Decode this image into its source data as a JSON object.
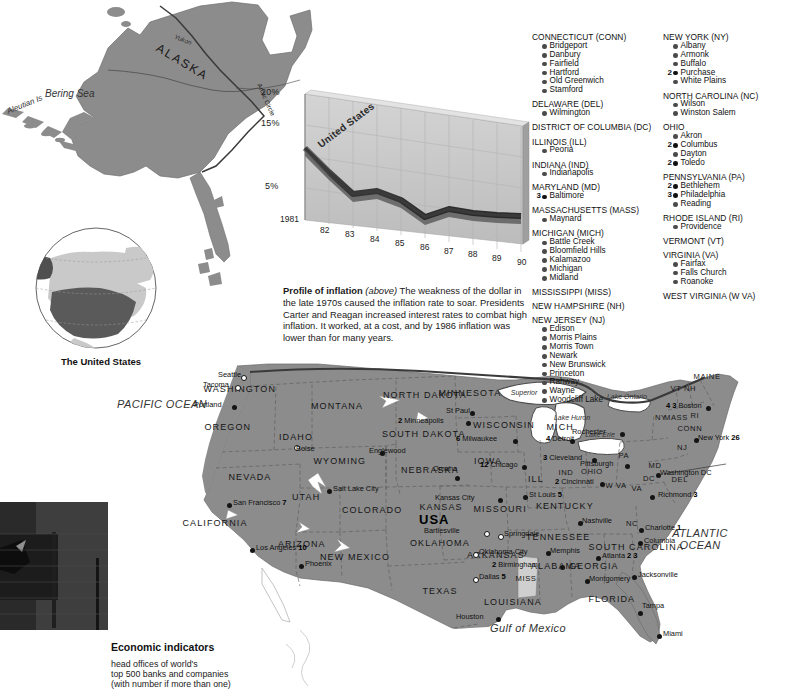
{
  "page": {
    "title": "The United States",
    "globe_caption": "The United States"
  },
  "chart_data": {
    "type": "line",
    "title": "Profile of inflation",
    "series_name": "United States",
    "xlabel": "",
    "ylabel": "",
    "ylim": [
      0,
      20
    ],
    "ytick_labels": [
      "20%",
      "15%",
      "5%"
    ],
    "ytick_values": [
      20,
      15,
      5
    ],
    "grid": true,
    "legend_position": "inline-on-line",
    "categories": [
      "1981",
      "82",
      "83",
      "84",
      "85",
      "86",
      "87",
      "88",
      "89",
      "90"
    ],
    "x": [
      1981,
      1982,
      1983,
      1984,
      1985,
      1986,
      1987,
      1988,
      1989,
      1990
    ],
    "values": [
      10.3,
      6.2,
      3.2,
      4.3,
      3.6,
      1.9,
      3.6,
      4.1,
      4.8,
      5.4
    ],
    "annotations": [
      "United States"
    ]
  },
  "inflation_caption": {
    "lead": "Profile of inflation",
    "italic": "(above)",
    "body": " The weakness of the dollar in the late 1970s caused the inflation rate to soar. Presidents Carter and Reagan increased interest rates to combat high inflation. It worked, at a cost, and by 1986 inflation was lower than for many years."
  },
  "legend": {
    "title": "Economic indicators",
    "lines": [
      "head offices of world's",
      "top 500 banks and companies",
      "(with number if more than one)"
    ]
  },
  "directory": {
    "column1": [
      {
        "state": "CONNECTICUT (CONN)",
        "cities": [
          {
            "name": "Bridgeport",
            "count": ""
          },
          {
            "name": "Danbury",
            "count": ""
          },
          {
            "name": "Fairfield",
            "count": ""
          },
          {
            "name": "Hartford",
            "count": ""
          },
          {
            "name": "Old Greenwich",
            "count": ""
          },
          {
            "name": "Stamford",
            "count": ""
          }
        ]
      },
      {
        "state": "DELAWARE (DEL)",
        "cities": [
          {
            "name": "Wilmington",
            "count": ""
          }
        ]
      },
      {
        "state": "DISTRICT OF COLUMBIA (DC)",
        "cities": []
      },
      {
        "state": "ILLINOIS (ILL)",
        "cities": [
          {
            "name": "Peoria",
            "count": ""
          }
        ]
      },
      {
        "state": "INDIANA (IND)",
        "cities": [
          {
            "name": "Indianapolis",
            "count": ""
          }
        ]
      },
      {
        "state": "MARYLAND (MD)",
        "cities": [
          {
            "name": "Baltimore",
            "count": "3"
          }
        ]
      },
      {
        "state": "MASSACHUSETTS (MASS)",
        "cities": [
          {
            "name": "Maynard",
            "count": ""
          }
        ]
      },
      {
        "state": "MICHIGAN (MICH)",
        "cities": [
          {
            "name": "Battle Creek",
            "count": ""
          },
          {
            "name": "Bloomfield Hills",
            "count": ""
          },
          {
            "name": "Kalamazoo",
            "count": ""
          },
          {
            "name": "Michigan",
            "count": ""
          },
          {
            "name": "Midland",
            "count": ""
          }
        ]
      },
      {
        "state": "MISSISSIPPI (MISS)",
        "cities": []
      },
      {
        "state": "NEW HAMPSHIRE (NH)",
        "cities": []
      },
      {
        "state": "NEW JERSEY (NJ)",
        "cities": [
          {
            "name": "Edison",
            "count": ""
          },
          {
            "name": "Morris Plains",
            "count": ""
          },
          {
            "name": "Morris Town",
            "count": ""
          },
          {
            "name": "Newark",
            "count": ""
          },
          {
            "name": "New Brunswick",
            "count": ""
          },
          {
            "name": "Princeton",
            "count": ""
          },
          {
            "name": "Rahway",
            "count": ""
          },
          {
            "name": "Wayne",
            "count": ""
          },
          {
            "name": "Woodcliff Lake",
            "count": ""
          }
        ]
      }
    ],
    "column2": [
      {
        "state": "NEW YORK (NY)",
        "cities": [
          {
            "name": "Albany",
            "count": ""
          },
          {
            "name": "Armonk",
            "count": ""
          },
          {
            "name": "Buffalo",
            "count": ""
          },
          {
            "name": "Purchase",
            "count": "2"
          },
          {
            "name": "White Plains",
            "count": ""
          }
        ]
      },
      {
        "state": "NORTH CAROLINA (NC)",
        "cities": [
          {
            "name": "Wilson",
            "count": ""
          },
          {
            "name": "Winston Salem",
            "count": ""
          }
        ]
      },
      {
        "state": "OHIO",
        "cities": [
          {
            "name": "Akron",
            "count": ""
          },
          {
            "name": "Columbus",
            "count": "2"
          },
          {
            "name": "Dayton",
            "count": ""
          },
          {
            "name": "Toledo",
            "count": "2"
          }
        ]
      },
      {
        "state": "PENNSYLVANIA (PA)",
        "cities": [
          {
            "name": "Bethlehem",
            "count": "2"
          },
          {
            "name": "Philadelphia",
            "count": "3"
          },
          {
            "name": "Reading",
            "count": ""
          }
        ]
      },
      {
        "state": "RHODE ISLAND (RI)",
        "cities": [
          {
            "name": "Providence",
            "count": ""
          }
        ]
      },
      {
        "state": "VERMONT (VT)",
        "cities": []
      },
      {
        "state": "VIRGINIA (VA)",
        "cities": [
          {
            "name": "Fairfax",
            "count": ""
          },
          {
            "name": "Falls Church",
            "count": ""
          },
          {
            "name": "Roanoke",
            "count": ""
          }
        ]
      },
      {
        "state": "WEST VIRGINIA (W VA)",
        "cities": []
      }
    ]
  },
  "map": {
    "alaska": {
      "state": "ALASKA",
      "river": "Yukon",
      "sea": "Bering Sea",
      "islands": "Aleutian Is",
      "circle": "Arctic Circle"
    },
    "oceans": [
      {
        "name": "PACIFIC OCEAN",
        "x": 162,
        "y": 398
      },
      {
        "name": "ATLANTIC OCEAN",
        "x": 700,
        "y": 527
      },
      {
        "name": "Gulf of Mexico",
        "x": 528,
        "y": 622
      }
    ],
    "lakes": [
      {
        "name": "Superior",
        "x": 524,
        "y": 389
      },
      {
        "name": "Lake Ontario",
        "x": 627,
        "y": 393
      },
      {
        "name": "Lake Huron",
        "x": 572,
        "y": 414
      },
      {
        "name": "Lake Erie",
        "x": 600,
        "y": 431
      }
    ],
    "states": [
      {
        "name": "WASHINGTON",
        "x": 240,
        "y": 390,
        "size": "lg"
      },
      {
        "name": "OREGON",
        "x": 228,
        "y": 428,
        "size": "lg"
      },
      {
        "name": "IDAHO",
        "x": 296,
        "y": 438,
        "size": "lg"
      },
      {
        "name": "MONTANA",
        "x": 337,
        "y": 407,
        "size": "lg"
      },
      {
        "name": "WYOMING",
        "x": 340,
        "y": 462,
        "size": "lg"
      },
      {
        "name": "NEVADA",
        "x": 250,
        "y": 478,
        "size": "lg"
      },
      {
        "name": "UTAH",
        "x": 306,
        "y": 498,
        "size": "lg"
      },
      {
        "name": "CALIFORNIA",
        "x": 215,
        "y": 524,
        "size": "lg"
      },
      {
        "name": "ARIZONA",
        "x": 302,
        "y": 545,
        "size": "lg"
      },
      {
        "name": "NEW MEXICO",
        "x": 355,
        "y": 558,
        "size": "lg"
      },
      {
        "name": "COLORADO",
        "x": 372,
        "y": 511,
        "size": "lg"
      },
      {
        "name": "NORTH DAKOTA",
        "x": 425,
        "y": 396,
        "size": "lg"
      },
      {
        "name": "SOUTH DAKOTA",
        "x": 424,
        "y": 435,
        "size": "lg"
      },
      {
        "name": "NEBRASKA",
        "x": 430,
        "y": 471,
        "size": "lg"
      },
      {
        "name": "KANSAS",
        "x": 441,
        "y": 508,
        "size": "lg"
      },
      {
        "name": "OKLAHOMA",
        "x": 440,
        "y": 544,
        "size": "lg"
      },
      {
        "name": "TEXAS",
        "x": 440,
        "y": 592,
        "size": "lg"
      },
      {
        "name": "MINNESOTA",
        "x": 470,
        "y": 394,
        "size": "lg"
      },
      {
        "name": "IOWA",
        "x": 488,
        "y": 462,
        "size": "lg"
      },
      {
        "name": "MISSOURI",
        "x": 500,
        "y": 510,
        "size": "lg"
      },
      {
        "name": "ARKANSAS",
        "x": 496,
        "y": 556,
        "size": "lg"
      },
      {
        "name": "LOUISIANA",
        "x": 513,
        "y": 603,
        "size": "lg"
      },
      {
        "name": "WISCONSIN",
        "x": 504,
        "y": 426,
        "size": "lg"
      },
      {
        "name": "ILL",
        "x": 536,
        "y": 480,
        "size": "lg"
      },
      {
        "name": "MICH",
        "x": 560,
        "y": 428,
        "size": "lg"
      },
      {
        "name": "IND",
        "x": 566,
        "y": 474,
        "size": "sm"
      },
      {
        "name": "OHIO",
        "x": 592,
        "y": 473,
        "size": "sm"
      },
      {
        "name": "KENTUCKY",
        "x": 565,
        "y": 507,
        "size": "lg"
      },
      {
        "name": "TENNESSEE",
        "x": 558,
        "y": 538,
        "size": "lg"
      },
      {
        "name": "MISS",
        "x": 526,
        "y": 580,
        "size": "sm"
      },
      {
        "name": "ALABAMA",
        "x": 556,
        "y": 567,
        "size": "lg"
      },
      {
        "name": "GEORGIA",
        "x": 594,
        "y": 567,
        "size": "lg"
      },
      {
        "name": "FLORIDA",
        "x": 612,
        "y": 600,
        "size": "lg"
      },
      {
        "name": "SOUTH CAROLINA",
        "x": 636,
        "y": 548,
        "size": "lg"
      },
      {
        "name": "NC",
        "x": 632,
        "y": 525,
        "size": "sm"
      },
      {
        "name": "W VA",
        "x": 616,
        "y": 487,
        "size": "sm"
      },
      {
        "name": "VA",
        "x": 637,
        "y": 490,
        "size": "sm"
      },
      {
        "name": "PA",
        "x": 624,
        "y": 457,
        "size": "sm"
      },
      {
        "name": "NY",
        "x": 661,
        "y": 419,
        "size": "sm"
      },
      {
        "name": "VT",
        "x": 676,
        "y": 390,
        "size": "sm"
      },
      {
        "name": "NH",
        "x": 690,
        "y": 390,
        "size": "sm"
      },
      {
        "name": "MAINE",
        "x": 707,
        "y": 378,
        "size": "sm"
      },
      {
        "name": "MASS",
        "x": 676,
        "y": 419,
        "size": "sm"
      },
      {
        "name": "CONN",
        "x": 690,
        "y": 430,
        "size": "sm"
      },
      {
        "name": "NJ",
        "x": 682,
        "y": 449,
        "size": "sm"
      },
      {
        "name": "MD",
        "x": 655,
        "y": 467,
        "size": "sm"
      },
      {
        "name": "DEL",
        "x": 680,
        "y": 481,
        "size": "sm"
      },
      {
        "name": "DC",
        "x": 649,
        "y": 480,
        "size": "sm"
      },
      {
        "name": "RI",
        "x": 695,
        "y": 417,
        "size": "sm"
      },
      {
        "name": "USA",
        "x": 434,
        "y": 518,
        "size": "usa"
      }
    ],
    "cities": [
      {
        "name": "Seattle",
        "x": 241,
        "y": 375,
        "num": "",
        "dot": "hollow",
        "dx": -28,
        "dy": -1
      },
      {
        "name": "Tacoma",
        "x": 235,
        "y": 385,
        "num": "",
        "dot": "hollow",
        "dx": -34,
        "dy": -1
      },
      {
        "name": "Portland",
        "x": 232,
        "y": 405,
        "num": "",
        "dot": "solid",
        "dx": -38,
        "dy": -1
      },
      {
        "name": "Boise",
        "x": 294,
        "y": 445,
        "num": "",
        "dot": "hollow",
        "dx": 2,
        "dy": 3
      },
      {
        "name": "Salt Lake City",
        "x": 327,
        "y": 489,
        "num": "",
        "dot": "solid",
        "dx": 6,
        "dy": -1
      },
      {
        "name": "San Francisco",
        "x": 227,
        "y": 503,
        "num": "7",
        "dot": "solid",
        "dx": 6,
        "dy": -1
      },
      {
        "name": "Los Angeles",
        "x": 250,
        "y": 548,
        "num": "10",
        "dot": "solid",
        "dx": 6,
        "dy": -1
      },
      {
        "name": "Phoenix",
        "x": 299,
        "y": 564,
        "num": "",
        "dot": "solid",
        "dx": 6,
        "dy": -1
      },
      {
        "name": "Englewood",
        "x": 380,
        "y": 451,
        "num": "",
        "dot": "solid",
        "dx": -2,
        "dy": -1
      },
      {
        "name": "Minneapolis",
        "x": 466,
        "y": 421,
        "num": "2",
        "dot": "solid",
        "dx": -50,
        "dy": -1
      },
      {
        "name": "St Paul",
        "x": 470,
        "y": 411,
        "num": "",
        "dot": "solid",
        "dx": -28,
        "dy": -1
      },
      {
        "name": "Milwaukee",
        "x": 513,
        "y": 439,
        "num": "6",
        "dot": "solid",
        "dx": -44,
        "dy": -1
      },
      {
        "name": "Chicago",
        "x": 522,
        "y": 465,
        "num": "12",
        "dot": "solid",
        "dx": -32,
        "dy": -1
      },
      {
        "name": "Detroit",
        "x": 570,
        "y": 439,
        "num": "4",
        "dot": "solid",
        "dx": -24,
        "dy": -1
      },
      {
        "name": "Cleveland",
        "x": 592,
        "y": 458,
        "num": "3",
        "dot": "solid",
        "dx": -38,
        "dy": -1
      },
      {
        "name": "Cincinnati",
        "x": 600,
        "y": 482,
        "num": "2",
        "dot": "solid",
        "dx": -34,
        "dy": -1
      },
      {
        "name": "Pittsburgh",
        "x": 625,
        "y": 464,
        "num": "",
        "dot": "solid",
        "dx": -40,
        "dy": -1
      },
      {
        "name": "Rochester",
        "x": 620,
        "y": 432,
        "num": "",
        "dot": "solid",
        "dx": -42,
        "dy": -1
      },
      {
        "name": "Boston",
        "x": 706,
        "y": 406,
        "num": "4 3",
        "dot": "solid",
        "dx": -32,
        "dy": -1
      },
      {
        "name": "New York",
        "x": 694,
        "y": 438,
        "num": "26",
        "dot": "solid",
        "dx": 4,
        "dy": -1
      },
      {
        "name": "Washington DC",
        "x": 656,
        "y": 473,
        "num": "",
        "dot": "solid",
        "dx": 4,
        "dy": -1
      },
      {
        "name": "Richmond",
        "x": 650,
        "y": 495,
        "num": "3",
        "dot": "solid",
        "dx": 8,
        "dy": -1
      },
      {
        "name": "Charlotte",
        "x": 639,
        "y": 528,
        "num": "1",
        "dot": "solid",
        "dx": 6,
        "dy": -1
      },
      {
        "name": "Columbia",
        "x": 638,
        "y": 541,
        "num": "",
        "dot": "solid",
        "dx": 6,
        "dy": -1
      },
      {
        "name": "Atlanta",
        "x": 596,
        "y": 556,
        "num": "2  3",
        "dot": "solid",
        "dx": 6,
        "dy": -1
      },
      {
        "name": "Montgomery",
        "x": 585,
        "y": 579,
        "num": "",
        "dot": "solid",
        "dx": 4,
        "dy": -1
      },
      {
        "name": "Birmingham",
        "x": 560,
        "y": 565,
        "num": "2",
        "dot": "solid",
        "dx": -50,
        "dy": -1
      },
      {
        "name": "Nashville",
        "x": 578,
        "y": 521,
        "num": "",
        "dot": "solid",
        "dx": 4,
        "dy": -1
      },
      {
        "name": "Memphis",
        "x": 546,
        "y": 551,
        "num": "",
        "dot": "solid",
        "dx": 4,
        "dy": -1
      },
      {
        "name": "St Louis",
        "x": 523,
        "y": 495,
        "num": "5",
        "dot": "solid",
        "dx": 6,
        "dy": -1
      },
      {
        "name": "Kansas City",
        "x": 498,
        "y": 498,
        "num": "",
        "dot": "solid",
        "dx": -52,
        "dy": -1
      },
      {
        "name": "Omaha",
        "x": 455,
        "y": 476,
        "num": "",
        "dot": "solid",
        "dx": -26,
        "dy": -8
      },
      {
        "name": "Springdale",
        "x": 498,
        "y": 534,
        "num": "",
        "dot": "hollow",
        "dx": 6,
        "dy": -1
      },
      {
        "name": "Bartlesville",
        "x": 484,
        "y": 531,
        "num": "",
        "dot": "hollow",
        "dx": -52,
        "dy": -1
      },
      {
        "name": "Oklahoma City",
        "x": 473,
        "y": 552,
        "num": "",
        "dot": "hollow",
        "dx": 6,
        "dy": -1
      },
      {
        "name": "Dallas",
        "x": 473,
        "y": 577,
        "num": "5",
        "dot": "hollow",
        "dx": 6,
        "dy": -1
      },
      {
        "name": "Houston",
        "x": 496,
        "y": 617,
        "num": "",
        "dot": "solid",
        "dx": -40,
        "dy": -1
      },
      {
        "name": "Jacksonville",
        "x": 632,
        "y": 575,
        "num": "",
        "dot": "solid",
        "dx": 6,
        "dy": -1
      },
      {
        "name": "Tampa",
        "x": 638,
        "y": 611,
        "num": "",
        "dot": "solid",
        "dx": 4,
        "dy": -6
      },
      {
        "name": "Miami",
        "x": 657,
        "y": 634,
        "num": "",
        "dot": "solid",
        "dx": 6,
        "dy": -1
      }
    ]
  },
  "colors": {
    "land": "#8c8c8c",
    "land_light": "#c9c9c9",
    "water": "#ffffff",
    "chart_line": "#4a4a4a",
    "chart_panel": "#c8c8c8",
    "text": "#111111"
  }
}
